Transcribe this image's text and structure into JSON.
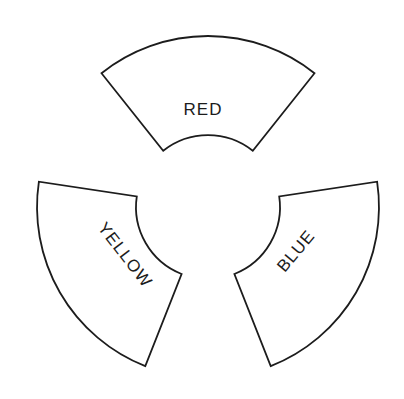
{
  "figure": {
    "canvas": {
      "width": 404,
      "height": 399
    },
    "background_color": "#ffffff",
    "shape_fill_color": "#ffffff",
    "outline_color": "#1c1c1c",
    "outline_width": 1.8,
    "center": {
      "x": 208,
      "y": 207
    },
    "inner_radius": 72,
    "outer_radius": 171,
    "sector_half_angle_deg": 38.5,
    "label_font_size": 17,
    "sectors": [
      {
        "label": "RED",
        "center_angle_deg": 90,
        "label_x": 203,
        "label_y": 109,
        "label_rotation_deg": 0
      },
      {
        "label": "YELLOW",
        "center_angle_deg": 210,
        "label_x": 125,
        "label_y": 255,
        "label_rotation_deg": 52
      },
      {
        "label": "BLUE",
        "center_angle_deg": 330,
        "label_x": 296,
        "label_y": 251,
        "label_rotation_deg": -50
      }
    ]
  }
}
